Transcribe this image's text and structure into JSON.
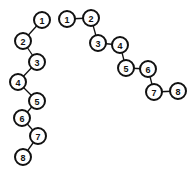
{
  "diagram": {
    "background": "#ffffff",
    "stroke_color": "#111111",
    "node_radius": 8,
    "chains": [
      {
        "name": "left-chain",
        "layout": "zigzag-vertical",
        "nodes": [
          {
            "label": "1",
            "x": 42,
            "y": 20
          },
          {
            "label": "2",
            "x": 23,
            "y": 41
          },
          {
            "label": "3",
            "x": 37,
            "y": 62
          },
          {
            "label": "4",
            "x": 18,
            "y": 82
          },
          {
            "label": "5",
            "x": 37,
            "y": 101
          },
          {
            "label": "6",
            "x": 22,
            "y": 118
          },
          {
            "label": "7",
            "x": 38,
            "y": 136
          },
          {
            "label": "8",
            "x": 23,
            "y": 157
          }
        ]
      },
      {
        "name": "right-chain",
        "layout": "staircase-diagonal",
        "nodes": [
          {
            "label": "1",
            "x": 67,
            "y": 19
          },
          {
            "label": "2",
            "x": 91,
            "y": 18
          },
          {
            "label": "3",
            "x": 98,
            "y": 43
          },
          {
            "label": "4",
            "x": 120,
            "y": 45
          },
          {
            "label": "5",
            "x": 126,
            "y": 68
          },
          {
            "label": "6",
            "x": 148,
            "y": 69
          },
          {
            "label": "7",
            "x": 154,
            "y": 92
          },
          {
            "label": "8",
            "x": 178,
            "y": 91
          }
        ]
      }
    ]
  }
}
